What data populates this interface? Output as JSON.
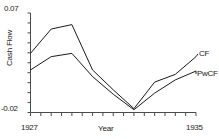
{
  "chart_data": {
    "type": "line",
    "title": "",
    "xlabel": "Year",
    "ylabel": "Cash Flow",
    "xlim": [
      1927,
      1935
    ],
    "ylim": [
      -0.02,
      0.07
    ],
    "grid": false,
    "legend_position": "right-inline",
    "x_tick_labels": [
      "1927",
      "1935"
    ],
    "y_tick_labels": [
      "0.07",
      "-0.02"
    ],
    "x_minor_ticks": [
      1927,
      1927.5,
      1928,
      1928.5,
      1929,
      1929.5,
      1930,
      1930.5,
      1931,
      1931.5,
      1932,
      1932.5,
      1933,
      1933.5,
      1934,
      1934.5,
      1935
    ],
    "y_minor_tick_count": 10,
    "x": [
      1927,
      1928,
      1929,
      1930,
      1931,
      1932,
      1933,
      1934,
      1935
    ],
    "series": [
      {
        "name": "CF",
        "label": "CF",
        "color": "#1a1a1a",
        "values": [
          0.0335,
          0.0555,
          0.0595,
          0.0185,
          0.0005,
          -0.0165,
          0.0075,
          0.0145,
          0.0305
        ]
      },
      {
        "name": "PwCF",
        "label": "PwCF",
        "color": "#1a1a1a",
        "values": [
          0.0185,
          0.0305,
          0.0335,
          0.0125,
          -0.0035,
          -0.0175,
          -0.0025,
          0.0095,
          0.0175
        ]
      }
    ]
  },
  "axes": {
    "y_top_label": "0.07",
    "y_bottom_label": "-0.02",
    "y_title": "Cash Flow",
    "x_left_label": "1927",
    "x_right_label": "1935",
    "x_title": "Year"
  },
  "legend": {
    "cf_label": "CF",
    "pwcf_label": "PwCF"
  },
  "style": {
    "axis_color": "#4a4a4a",
    "line_color": "#1a1a1a",
    "background": "#ffffff"
  }
}
